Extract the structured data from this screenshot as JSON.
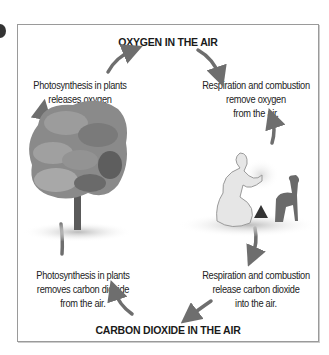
{
  "diagram": {
    "top_title": "OXYGEN IN THE AIR",
    "bottom_title": "CARBON DIOXIDE IN THE AIR",
    "captions": {
      "top_left": [
        "Photosynthesis in plants",
        "releases oxygen",
        "into the air."
      ],
      "top_right": [
        "Respiration and combustion",
        "remove oxygen",
        "from the air."
      ],
      "bottom_left": [
        "Photosynthesis in plants",
        "removes carbon dioxide",
        "from the air."
      ],
      "bottom_right": [
        "Respiration and combustion",
        "release carbon dioxide",
        "into the air."
      ]
    },
    "illustrations": {
      "left": "tree",
      "right": "person-at-campfire-with-dog"
    },
    "colors": {
      "arrow": "#6e6e6e",
      "border": "#9a9a9a",
      "tree": "#8a8a8a"
    }
  }
}
